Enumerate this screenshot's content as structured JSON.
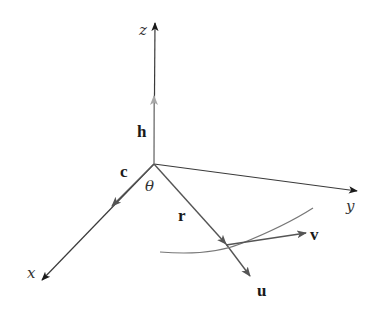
{
  "figure": {
    "origin": [
      154,
      164
    ],
    "colors": {
      "axis": "#3a3a3a",
      "axis_head": "#1a1a1a",
      "h_vector": "#a8a8a8",
      "vector": "#555555",
      "curve": "#777777"
    }
  },
  "axes": [
    {
      "name": "z",
      "label": "z",
      "tip": [
        155,
        23
      ]
    },
    {
      "name": "y",
      "label": "y",
      "tip": [
        357,
        191
      ]
    },
    {
      "name": "x",
      "label": "x",
      "tip": [
        42,
        280
      ]
    }
  ],
  "vectors": [
    {
      "name": "h",
      "label": "h",
      "from": [
        154,
        164
      ],
      "to": [
        154,
        96
      ]
    },
    {
      "name": "c",
      "label": "c",
      "from": [
        154,
        164
      ],
      "to": [
        112,
        206
      ]
    },
    {
      "name": "r",
      "label": "r",
      "from": [
        154,
        164
      ],
      "to": [
        226,
        244
      ]
    },
    {
      "name": "u",
      "label": "u",
      "from": [
        226,
        244
      ],
      "to": [
        250,
        276
      ]
    },
    {
      "name": "v",
      "label": "v",
      "from": [
        226,
        245
      ],
      "to": [
        306,
        233
      ]
    }
  ],
  "angle": {
    "label": "θ"
  },
  "labels": {
    "z": "z",
    "y": "y",
    "x": "x",
    "h": "h",
    "c": "c",
    "r": "r",
    "u": "u",
    "v": "v",
    "theta": "θ"
  }
}
